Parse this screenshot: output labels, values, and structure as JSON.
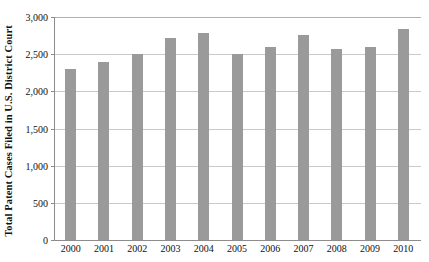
{
  "chart_data": {
    "type": "bar",
    "title": "",
    "subtitle": "",
    "xlabel": "",
    "ylabel": "Total Patent Cases Filed in U.S. District Court",
    "categories": [
      "2000",
      "2001",
      "2002",
      "2003",
      "2004",
      "2005",
      "2006",
      "2007",
      "2008",
      "2009",
      "2010"
    ],
    "values": [
      2300,
      2400,
      2500,
      2720,
      2785,
      2500,
      2600,
      2760,
      2570,
      2590,
      2840
    ],
    "series": [
      {
        "name": "Total Patent Cases Filed in U.S. District Court",
        "values": [
          2300,
          2400,
          2500,
          2720,
          2785,
          2500,
          2600,
          2760,
          2570,
          2590,
          2840
        ]
      }
    ],
    "ylim": [
      0,
      3000
    ],
    "ytick_values": [
      0,
      500,
      1000,
      1500,
      2000,
      2500,
      3000
    ],
    "ytick_labels": [
      "0",
      "500",
      "1,000",
      "1,500",
      "2,000",
      "2,500",
      "3,000"
    ],
    "grid": true,
    "grid_axis": "y",
    "legend": false,
    "legend_position": "none",
    "annotations": [],
    "colors": {
      "bar": "#9a9a9a",
      "gridline": "#c9c9c9",
      "axis": "#8c8c8c",
      "text": "#111111",
      "background": "#ffffff"
    }
  }
}
